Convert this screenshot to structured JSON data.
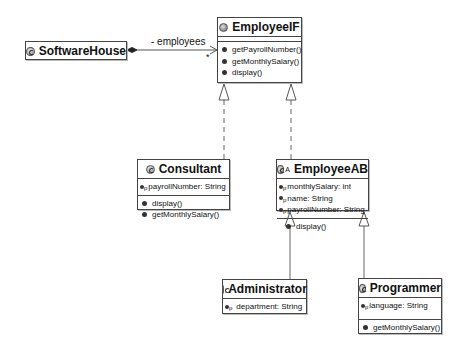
{
  "diagram": {
    "type": "UML class diagram",
    "classes": {
      "software_house": {
        "name": "SoftwareHouse",
        "kind": "class",
        "attributes": [],
        "methods": []
      },
      "employee_if": {
        "name": "EmployeeIF",
        "kind": "interface",
        "attributes": [],
        "methods": [
          "getPayrollNumber()",
          "getMonthlySalary()",
          "display()"
        ]
      },
      "consultant": {
        "name": "Consultant",
        "kind": "class",
        "attributes": [
          "payrollNumber: String"
        ],
        "methods": [
          "display()",
          "getMonthlySalary()"
        ]
      },
      "employee_ab": {
        "name": "EmployeeAB",
        "kind": "abstract class",
        "abstract_marker": "A",
        "attributes": [
          "monthlySalary: int",
          "name: String",
          "payrollNumber: String"
        ],
        "methods": [
          "display()"
        ]
      },
      "administrator": {
        "name": "Administrator",
        "kind": "class",
        "attributes": [
          "department: String"
        ],
        "methods": []
      },
      "programmer": {
        "name": "Programmer",
        "kind": "class",
        "attributes": [
          "language: String"
        ],
        "methods": [
          "getMonthlySalary()"
        ]
      }
    },
    "attribute_visibility_marker": "p",
    "relations": [
      {
        "from": "SoftwareHouse",
        "to": "EmployeeIF",
        "type": "composition",
        "role": "- employees",
        "multiplicity": "*"
      },
      {
        "from": "Consultant",
        "to": "EmployeeIF",
        "type": "realization"
      },
      {
        "from": "EmployeeAB",
        "to": "EmployeeIF",
        "type": "realization"
      },
      {
        "from": "Administrator",
        "to": "EmployeeAB",
        "type": "generalization"
      },
      {
        "from": "Programmer",
        "to": "EmployeeAB",
        "type": "generalization"
      }
    ]
  }
}
